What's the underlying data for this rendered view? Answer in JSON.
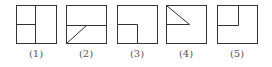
{
  "figures": [
    {
      "label": "(1)",
      "x": 16,
      "description": "square with vertical divider and left horizontal divider"
    },
    {
      "label": "(2)",
      "x": 66,
      "description": "square with horizontal midline and diagonal from bottom-left to midline"
    },
    {
      "label": "(3)",
      "x": 117,
      "description": "square with small square in bottom-left"
    },
    {
      "label": "(4)",
      "x": 166,
      "description": "square with triangle in upper-left"
    },
    {
      "label": "(5)",
      "x": 217,
      "description": "square with small square in top-left"
    }
  ],
  "colors": {
    "stroke": "#333333",
    "label": "#555555"
  }
}
